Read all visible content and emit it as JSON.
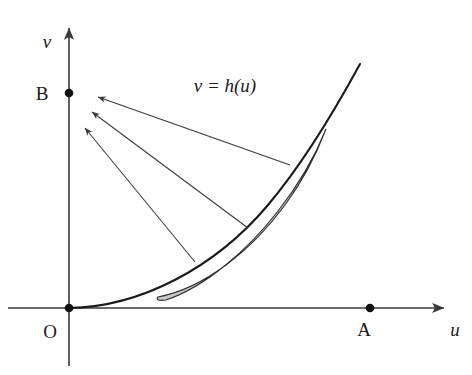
{
  "figure": {
    "background_color": "#ffffff",
    "width": 472,
    "height": 375
  },
  "axes": {
    "vertical": {
      "label": "v",
      "name": "v-axis",
      "x": 69,
      "top_y": 24,
      "bottom_y": 366,
      "label_x": 47,
      "label_y": 48,
      "arrow": "up"
    },
    "horizontal": {
      "label": "u",
      "name": "u-axis",
      "y": 308,
      "left_x": 8,
      "right_x": 448,
      "label_x": 455,
      "label_y": 336,
      "arrow": "right"
    },
    "origin": {
      "label": "O",
      "x": 69,
      "y": 308,
      "label_x": 50,
      "label_y": 338
    }
  },
  "marked_points": [
    {
      "label": "B",
      "x": 69,
      "y": 93,
      "label_x": 42,
      "label_y": 100,
      "on_axis": "v-axis"
    },
    {
      "label": "O",
      "x": 69,
      "y": 308,
      "label_x": 50,
      "label_y": 338,
      "on_axis": "origin"
    },
    {
      "label": "A",
      "x": 370,
      "y": 308,
      "label_x": 364,
      "label_y": 336,
      "on_axis": "u-axis"
    }
  ],
  "curve": {
    "label": "v = h(u)",
    "label_x": 225,
    "label_y": 92,
    "color": "#1a1a1a",
    "description": "convex increasing curve tangent to the u-axis at the origin",
    "path": "M 69 308 C 140 307 215 268 268 205 C 305 161 335 110 360 64"
  },
  "lens_region": {
    "name": "shaded-lens-region",
    "fill_color": "#c6c6c6",
    "stroke_color": "#2b2b2b",
    "description": "thin crescent lens hugging the inside of the curve",
    "lower_tip": {
      "x": 158,
      "y": 297
    },
    "upper_tip": {
      "x": 326,
      "y": 129
    },
    "path": "M 158 297 C 205 288 252 250 285 205 C 305 178 318 150 326 129 C 316 154 300 183 278 211 C 248 250 205 287 166 300 C 160 301 155 300 158 297 Z"
  },
  "pointer_arrows": [
    {
      "name": "pointer-arrow-upper",
      "tail": {
        "x": 290,
        "y": 165
      },
      "head": {
        "x": 98,
        "y": 97
      }
    },
    {
      "name": "pointer-arrow-middle",
      "tail": {
        "x": 248,
        "y": 228
      },
      "head": {
        "x": 92,
        "y": 112
      }
    },
    {
      "name": "pointer-arrow-lower",
      "tail": {
        "x": 195,
        "y": 262
      },
      "head": {
        "x": 85,
        "y": 128
      }
    }
  ]
}
